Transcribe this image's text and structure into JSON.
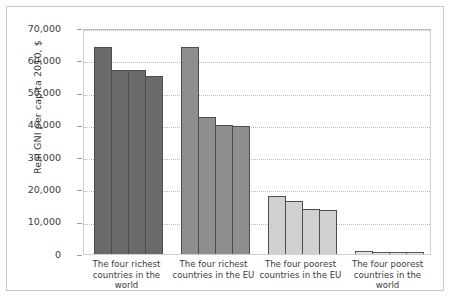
{
  "chart_data": {
    "type": "bar",
    "title": "",
    "xlabel": "",
    "ylabel": "Real GNI per capita 2010, $",
    "ylim": [
      0,
      70000
    ],
    "yticks": [
      "0",
      "10,000",
      "20,000",
      "30,000",
      "40,000",
      "50,000",
      "60,000",
      "70,000"
    ],
    "ytick_values": [
      0,
      10000,
      20000,
      30000,
      40000,
      50000,
      60000,
      70000
    ],
    "grid": true,
    "legend": "none",
    "categories": [
      "The four richest countries in the world",
      "The four richest countries in the EU",
      "The four poorest countries in the EU",
      "The four poorest countries in the world"
    ],
    "groups": [
      {
        "label": "The four richest countries in the world",
        "color": "#6a6a6a",
        "values": [
          64000,
          57000,
          57000,
          55000
        ]
      },
      {
        "label": "The four richest countries in the EU",
        "color": "#8e8e8e",
        "values": [
          64000,
          42500,
          40000,
          39500
        ]
      },
      {
        "label": "The four poorest countries in the EU",
        "color": "#d0d0d0",
        "values": [
          18000,
          16500,
          14000,
          13500
        ]
      },
      {
        "label": "The four poorest countries in the world",
        "color": "#e4e4e4",
        "values": [
          800,
          700,
          600,
          500
        ]
      }
    ]
  }
}
